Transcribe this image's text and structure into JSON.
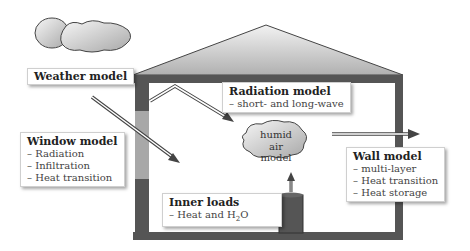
{
  "diagram": {
    "weather": {
      "title": "Weather model"
    },
    "window": {
      "title": "Window model",
      "items": [
        "– Radiation",
        "– Infiltration",
        "– Heat transition"
      ]
    },
    "radiation": {
      "title": "Radiation model",
      "items": [
        "– short- and long-wave"
      ]
    },
    "humid_air": {
      "line1": "humid air",
      "line2": "model"
    },
    "wall": {
      "title": "Wall model",
      "items": [
        "– multi-layer",
        "– Heat transition",
        "– Heat storage"
      ]
    },
    "inner_loads": {
      "title": "Inner loads",
      "item_prefix": "– Heat and H",
      "item_sub": "2",
      "item_suffix": "O"
    }
  },
  "colors": {
    "wall": "#555555",
    "window_upper": "#a8a8a8",
    "roof_top": "#f0f0f0",
    "roof_bottom": "#b8b8b8",
    "cloud_light": "#f2f2f2",
    "cloud_dark": "#a0a0a0"
  }
}
